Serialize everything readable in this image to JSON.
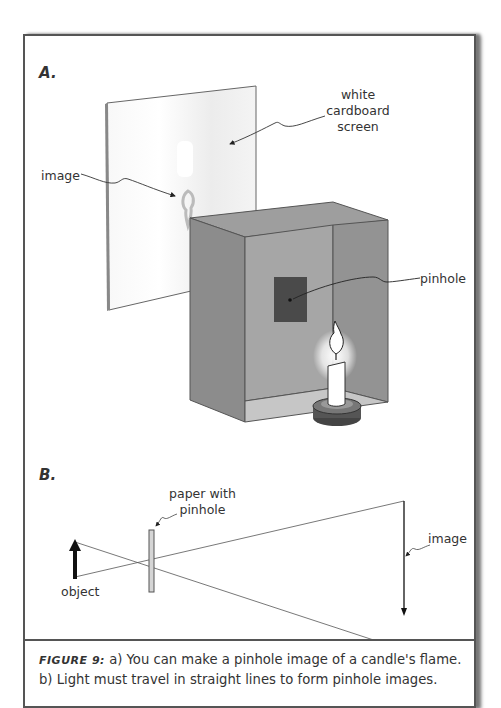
{
  "panel_a": {
    "letter": "A.",
    "labels": {
      "screen_line1": "white",
      "screen_line2": "cardboard",
      "screen_line3": "screen",
      "image": "image",
      "pinhole": "pinhole"
    }
  },
  "panel_b": {
    "letter": "B.",
    "labels": {
      "paper_line1": "paper with",
      "paper_line2": "pinhole",
      "image": "image",
      "object": "object"
    }
  },
  "caption": {
    "tag": "FIGURE 9:",
    "line1": "a) You can make a pinhole image of a candle's flame.",
    "line2": "b) Light must travel in straight lines to form pinhole images."
  },
  "colors": {
    "frame": "#555555",
    "box_side": "#8a8a8a",
    "box_front": "#a3a3a3",
    "screen": "#eeeeee",
    "pinhole_patch": "#4a4a4a"
  }
}
